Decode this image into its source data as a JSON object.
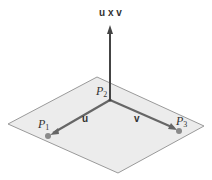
{
  "diagram": {
    "colors": {
      "plane_fill": "#ececec",
      "plane_edge": "#9a9a9a",
      "vector": "#555555",
      "point": "#8a8a8a",
      "text": "#333333"
    },
    "labels": {
      "normal": "u x v",
      "u": "u",
      "v": "v",
      "p1": "P",
      "p1_sub": "1",
      "p2": "P",
      "p2_sub": "2",
      "p3": "P",
      "p3_sub": "3"
    },
    "geometry": {
      "plane": [
        [
          97,
          77
        ],
        [
          204,
          126
        ],
        [
          118,
          173
        ],
        [
          8,
          124
        ]
      ],
      "origin_P2": [
        110,
        100
      ],
      "normal_tip": [
        110,
        26
      ],
      "P1": [
        48,
        136
      ],
      "P3": [
        179,
        131
      ]
    }
  }
}
